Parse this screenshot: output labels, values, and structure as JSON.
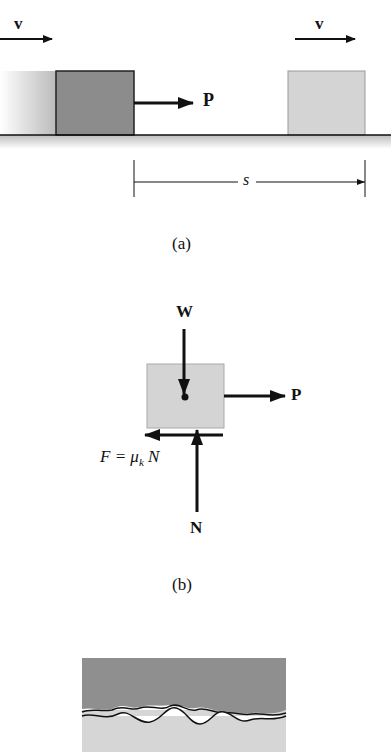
{
  "figure_a": {
    "caption": "(a)",
    "velocity_left_label": "v",
    "velocity_right_label": "v",
    "force_label": "P",
    "distance_label": "s"
  },
  "figure_b": {
    "caption": "(b)",
    "weight_label": "W",
    "force_label": "P",
    "normal_label": "N",
    "friction_label": "F = μ",
    "friction_sub": "k",
    "friction_tail": "N"
  },
  "figure_c": {
    "description": "magnified rough contact surfaces"
  },
  "colors": {
    "block_dark": "#8c8c8c",
    "block_light": "#d4d4d4",
    "ground": "#c8c8c8",
    "ink": "#111111"
  }
}
